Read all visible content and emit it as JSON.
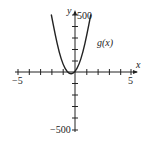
{
  "chart_data": {
    "type": "line",
    "title": "",
    "xlabel": "x",
    "ylabel": "y",
    "xlim": [
      -5,
      5
    ],
    "ylim": [
      -500,
      500
    ],
    "x_ticks": [
      -5,
      -4,
      -3,
      -2,
      -1,
      0,
      1,
      2,
      3,
      4,
      5
    ],
    "y_ticks": [
      -500,
      -400,
      -300,
      -200,
      -100,
      0,
      100,
      200,
      300,
      400,
      500
    ],
    "x_tick_labels": [
      "-5",
      "5"
    ],
    "y_tick_labels": [
      "500",
      "-500"
    ],
    "grid": false,
    "series": [
      {
        "name": "g(x)",
        "x": [
          -2.1,
          -1.75,
          -1.4,
          -1.05,
          -0.7,
          -0.35,
          0,
          0.35,
          0.7,
          1.05,
          1.4
        ],
        "values": [
          500,
          323,
          170,
          62,
          0,
          -21,
          0,
          62,
          170,
          323,
          500
        ]
      }
    ],
    "annotations": [
      {
        "text": "g(x)",
        "x": 1.7,
        "y": 300
      }
    ]
  },
  "labels": {
    "x_axis": "x",
    "y_axis": "y",
    "x_min": "−5",
    "x_max": "5",
    "y_max": "500",
    "y_min": "−500",
    "curve": "g(x)"
  }
}
